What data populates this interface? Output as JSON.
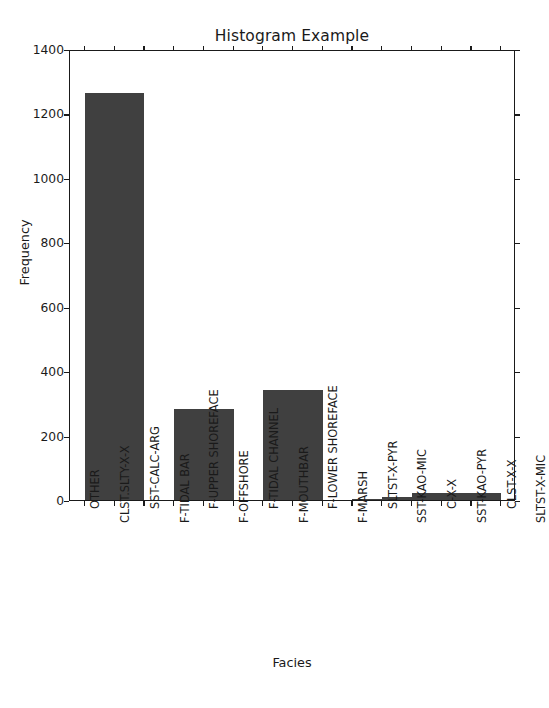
{
  "chart_data": {
    "type": "bar",
    "title": "Histogram Example",
    "xlabel": "Facies",
    "ylabel": "Frequency",
    "categories": [
      "OTHER",
      "CLST.SLTY-X-X",
      "SST-CALC-ARG",
      "F-TIDAL BAR",
      "F-UPPER SHOREFACE",
      "F-OFFSHORE",
      "F-TIDAL CHANNEL",
      "F-MOUTHBAR",
      "F-LOWER SHOREFACE",
      "F-MARSH",
      "SLTST-X-PYR",
      "SST-KAO-MIC",
      "C-X-X",
      "SST-KAO-PYR",
      "CLST-X-X",
      "SLTST-X-MIC"
    ],
    "values": [
      1265,
      1265,
      0,
      283,
      283,
      0,
      340,
      340,
      0,
      4,
      8,
      22,
      22,
      22,
      0,
      0
    ],
    "bins": [
      {
        "label": "OTHER / CLST.SLTY-X-X",
        "start_tick": 0,
        "end_tick": 2,
        "value": 1265
      },
      {
        "label": "SST-CALC-ARG",
        "start_tick": 2,
        "end_tick": 3,
        "value": 0
      },
      {
        "label": "F-TIDAL BAR / F-UPPER SHOREFACE",
        "start_tick": 3,
        "end_tick": 5,
        "value": 283
      },
      {
        "label": "F-OFFSHORE",
        "start_tick": 5,
        "end_tick": 6,
        "value": 0
      },
      {
        "label": "F-TIDAL CHANNEL / F-MOUTHBAR",
        "start_tick": 6,
        "end_tick": 8,
        "value": 340
      },
      {
        "label": "F-LOWER SHOREFACE",
        "start_tick": 8,
        "end_tick": 9,
        "value": 0
      },
      {
        "label": "F-MARSH",
        "start_tick": 9,
        "end_tick": 10,
        "value": 4
      },
      {
        "label": "SLTST-X-PYR",
        "start_tick": 10,
        "end_tick": 11,
        "value": 8
      },
      {
        "label": "SST-KAO-MIC / C-X-X / SST-KAO-PYR",
        "start_tick": 11,
        "end_tick": 14,
        "value": 22
      },
      {
        "label": "CLST-X-X / SLTST-X-MIC",
        "start_tick": 14,
        "end_tick": 15,
        "value": 0
      }
    ],
    "yticks": [
      0,
      200,
      400,
      600,
      800,
      1000,
      1200,
      1400
    ],
    "ylim": [
      0,
      1400
    ],
    "xtick_count": 15,
    "grid": false,
    "legend": "none",
    "bar_color": "#404040",
    "axis_color": "#1a1a1a",
    "background": "#ffffff"
  }
}
